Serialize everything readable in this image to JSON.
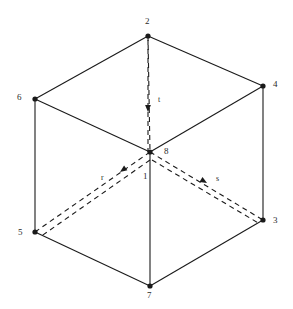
{
  "figure": {
    "type": "line-diagram",
    "background_color": "#ffffff",
    "line_color": "#1a1a1a",
    "dashed_line_color": "#1a1a1a",
    "label_color": "#2a2a2a",
    "width": 293,
    "height": 309
  },
  "vertices": [
    {
      "id": "v2",
      "label": "2",
      "x": 148,
      "y": 36,
      "label_x": 145,
      "label_y": 17,
      "hidden": false,
      "dot": true
    },
    {
      "id": "v6",
      "label": "6",
      "x": 35,
      "y": 99,
      "label_x": 17,
      "label_y": 93,
      "hidden": false,
      "dot": true
    },
    {
      "id": "v4",
      "label": "4",
      "x": 263,
      "y": 86,
      "label_x": 273,
      "label_y": 80,
      "hidden": false,
      "dot": true
    },
    {
      "id": "v8",
      "label": "8",
      "x": 150,
      "y": 152,
      "label_x": 164,
      "label_y": 147,
      "hidden": true,
      "dot": true
    },
    {
      "id": "v1",
      "label": "1",
      "x": 150,
      "y": 152,
      "label_x": 143,
      "label_y": 172,
      "hidden": false,
      "dot": false
    },
    {
      "id": "v5",
      "label": "5",
      "x": 35,
      "y": 232,
      "label_x": 18,
      "label_y": 228,
      "hidden": false,
      "dot": true
    },
    {
      "id": "v3",
      "label": "3",
      "x": 263,
      "y": 220,
      "label_x": 273,
      "label_y": 216,
      "hidden": false,
      "dot": true
    },
    {
      "id": "v7",
      "label": "7",
      "x": 150,
      "y": 286,
      "label_x": 147,
      "label_y": 291,
      "hidden": false,
      "dot": true
    }
  ],
  "solid_edges": [
    {
      "name": "edge-6-2",
      "from": "v6",
      "to": "v2"
    },
    {
      "name": "edge-2-4",
      "from": "v2",
      "to": "v4"
    },
    {
      "name": "edge-6-8",
      "from": "v6",
      "to": "v8"
    },
    {
      "name": "edge-8-4",
      "from": "v8",
      "to": "v4"
    },
    {
      "name": "edge-6-5",
      "from": "v6",
      "to": "v5"
    },
    {
      "name": "edge-4-3",
      "from": "v4",
      "to": "v3"
    },
    {
      "name": "edge-1-7",
      "from": "v1",
      "to": "v7"
    },
    {
      "name": "edge-5-7",
      "from": "v5",
      "to": "v7"
    },
    {
      "name": "edge-7-3",
      "from": "v7",
      "to": "v3"
    }
  ],
  "dashed_edges": [
    {
      "name": "edge-2-8-hidden",
      "from": "v2",
      "to": "v8"
    },
    {
      "name": "edge-8-5-hidden",
      "from": "v8",
      "to": "v5"
    },
    {
      "name": "edge-8-3-hidden",
      "from": "v8",
      "to": "v3"
    }
  ],
  "axes": [
    {
      "name": "axis-r",
      "label": "r",
      "label_x": 101,
      "label_y": 174,
      "from_x": 150,
      "from_y": 160,
      "to_x": 40,
      "to_y": 237,
      "arrow_x": 120,
      "arrow_y": 172,
      "arrow_angle": 145
    },
    {
      "name": "axis-s",
      "label": "s",
      "label_x": 216,
      "label_y": 175,
      "from_x": 152,
      "from_y": 160,
      "to_x": 260,
      "to_y": 224,
      "arrow_x": 207,
      "arrow_y": 183,
      "arrow_angle": 31
    },
    {
      "name": "axis-t",
      "label": "t",
      "label_x": 158,
      "label_y": 96,
      "from_x": 148,
      "from_y": 40,
      "to_x": 148,
      "to_y": 152,
      "arrow_x": 148,
      "arrow_y": 112,
      "arrow_angle": 90
    }
  ]
}
